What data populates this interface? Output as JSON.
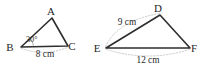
{
  "figure": {
    "background_color": "#ffffff",
    "line_color": "#2e2e2e",
    "dimension_line_color": "#b9b9b9",
    "text_color": "#262626",
    "triangles": [
      {
        "name": "triangle-abc",
        "vertices": [
          {
            "label": "A",
            "x": 52,
            "y": 18,
            "label_x": 51,
            "label_y": 15
          },
          {
            "label": "B",
            "x": 21,
            "y": 47,
            "label_x": 10,
            "label_y": 51
          },
          {
            "label": "C",
            "x": 68,
            "y": 46,
            "label_x": 72,
            "label_y": 50
          }
        ],
        "angles": [
          {
            "at": "B",
            "value": "30°",
            "label_x": 26,
            "label_y": 42
          }
        ],
        "dimensions": [
          {
            "side": "BC",
            "label": "8 cm",
            "label_x": 45,
            "label_y": 57
          }
        ]
      },
      {
        "name": "triangle-def",
        "vertices": [
          {
            "label": "D",
            "x": 160,
            "y": 15,
            "label_x": 158,
            "label_y": 12
          },
          {
            "label": "E",
            "x": 106,
            "y": 48,
            "label_x": 97,
            "label_y": 52
          },
          {
            "label": "F",
            "x": 190,
            "y": 48,
            "label_x": 194,
            "label_y": 52
          }
        ],
        "angles": [],
        "dimensions": [
          {
            "side": "ED",
            "label": "9 cm",
            "label_x": 127,
            "label_y": 25
          },
          {
            "side": "EF",
            "label": "12 cm",
            "label_x": 148,
            "label_y": 63
          }
        ]
      }
    ]
  }
}
